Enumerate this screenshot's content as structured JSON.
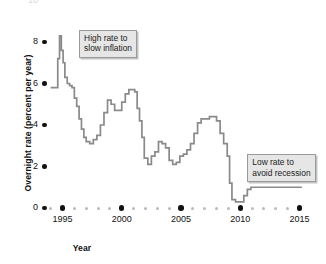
{
  "chart_data": {
    "type": "line",
    "title": "",
    "xlabel": "Year",
    "ylabel": "Overnight rate (percent per year)",
    "xlim": [
      1994,
      2015.4
    ],
    "ylim": [
      0,
      10
    ],
    "grid": false,
    "legend": "none",
    "y_ticks": [
      0,
      2,
      4,
      6,
      8,
      10
    ],
    "y_tick_labels": [
      "0",
      "2",
      "4",
      "6",
      "8",
      "10"
    ],
    "x_ticks": [
      1995,
      2000,
      2005,
      2010,
      2015
    ],
    "x_tick_labels": [
      "1995",
      "2000",
      "2005",
      "2010",
      "2015"
    ],
    "x_minor_ticks": [
      1994,
      1996,
      1997,
      1998,
      1999,
      2001,
      2002,
      2003,
      2004,
      2006,
      2007,
      2008,
      2009,
      2011,
      2012,
      2013,
      2014
    ],
    "series": [
      {
        "name": "Overnight rate",
        "color": "#8a8a8a",
        "step": true,
        "x": [
          1994.0,
          1994.3,
          1994.6,
          1994.75,
          1994.9,
          1995.05,
          1995.2,
          1995.4,
          1995.6,
          1995.8,
          1996.0,
          1996.2,
          1996.4,
          1996.6,
          1996.8,
          1997.0,
          1997.3,
          1997.6,
          1997.9,
          1998.2,
          1998.5,
          1998.8,
          1999.1,
          1999.4,
          1999.7,
          2000.0,
          2000.3,
          2000.6,
          2000.9,
          2001.1,
          2001.3,
          2001.5,
          2001.7,
          2001.9,
          2002.2,
          2002.5,
          2002.8,
          2003.1,
          2003.4,
          2003.7,
          2004.0,
          2004.3,
          2004.6,
          2004.9,
          2005.2,
          2005.5,
          2005.8,
          2006.1,
          2006.4,
          2006.7,
          2007.0,
          2007.4,
          2007.8,
          2008.0,
          2008.3,
          2008.6,
          2008.9,
          2009.1,
          2009.3,
          2009.6,
          2010.0,
          2010.3,
          2010.6,
          2010.9,
          2011.5,
          2012.5,
          2013.5,
          2014.5,
          2015.2
        ],
        "y": [
          5.8,
          5.8,
          7.2,
          8.3,
          7.6,
          7.0,
          6.3,
          6.0,
          5.9,
          5.8,
          5.3,
          4.9,
          4.3,
          3.8,
          3.4,
          3.2,
          3.1,
          3.3,
          3.5,
          4.0,
          4.6,
          5.2,
          5.0,
          4.7,
          4.7,
          5.1,
          5.5,
          5.7,
          5.7,
          5.6,
          4.8,
          4.2,
          3.4,
          2.4,
          2.1,
          2.5,
          2.7,
          3.2,
          3.1,
          2.9,
          2.3,
          2.1,
          2.2,
          2.5,
          2.6,
          2.8,
          3.1,
          3.6,
          4.1,
          4.3,
          4.3,
          4.4,
          4.4,
          4.2,
          3.6,
          3.1,
          2.5,
          1.2,
          0.4,
          0.3,
          0.3,
          0.6,
          0.9,
          1.0,
          1.0,
          1.0,
          1.0,
          1.0,
          1.0
        ]
      }
    ],
    "annotations": [
      {
        "name": "high-rate-callout",
        "text": "High rate to\nslow inflation",
        "x": 1996.4,
        "y": 8.6
      },
      {
        "name": "low-rate-callout",
        "text": "Low rate to\navoid recession",
        "x": 2010.6,
        "y": 2.6
      }
    ]
  }
}
